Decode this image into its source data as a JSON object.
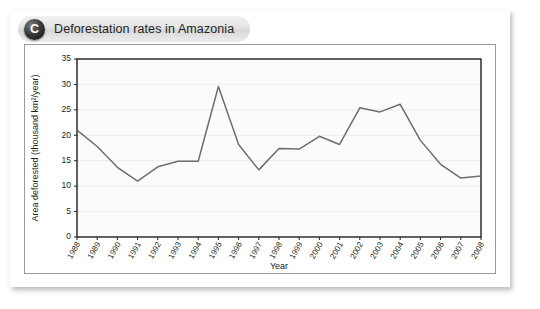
{
  "figure": {
    "panel_letter": "C",
    "panel_title": "Deforestation rates in Amazonia"
  },
  "chart_data": {
    "type": "line",
    "title": "Deforestation rates in Amazonia",
    "xlabel": "Year",
    "ylabel": "Area deforested (thousand km2/year)",
    "ylabel_display": "Area deforested (thousand km²/year)",
    "ylim": [
      0,
      35
    ],
    "yticks": [
      0,
      5,
      10,
      15,
      20,
      25,
      30,
      35
    ],
    "grid": "horizontal",
    "legend": "none",
    "categories": [
      "1988",
      "1989",
      "1990",
      "1991",
      "1992",
      "1993",
      "1994",
      "1995",
      "1996",
      "1997",
      "1998",
      "1999",
      "2000",
      "2001",
      "2002",
      "2003",
      "2004",
      "2005",
      "2006",
      "2007",
      "2008"
    ],
    "values": [
      21.0,
      17.8,
      13.7,
      11.0,
      13.8,
      14.9,
      14.9,
      29.6,
      18.2,
      13.2,
      17.4,
      17.3,
      19.8,
      18.2,
      25.4,
      24.6,
      26.1,
      19.0,
      14.3,
      11.6,
      12.0
    ],
    "series_name": "Area deforested"
  }
}
